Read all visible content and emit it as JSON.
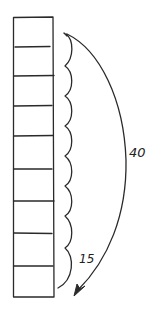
{
  "diagram": {
    "stack": {
      "cell_count": 9,
      "cells": [
        1,
        2,
        3,
        4,
        5,
        6,
        7,
        8,
        9
      ]
    },
    "labels": {
      "long_arc": "40",
      "scallops": "15"
    },
    "colors": {
      "stroke": "#2a2a2a",
      "background": "#ffffff"
    }
  }
}
